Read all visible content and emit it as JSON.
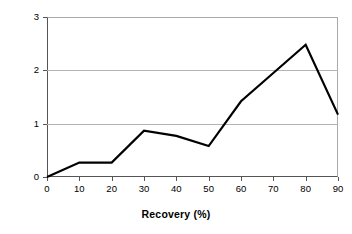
{
  "chart_data": {
    "type": "line",
    "title": "",
    "xlabel": "Recovery (%)",
    "ylabel": "Probability Density",
    "x": [
      0,
      10,
      20,
      30,
      40,
      50,
      60,
      70,
      80,
      90
    ],
    "values": [
      0.0,
      0.27,
      0.27,
      0.87,
      0.77,
      0.58,
      1.42,
      1.95,
      2.48,
      1.17
    ],
    "series": [
      {
        "name": "Probability Density",
        "values": [
          0.0,
          0.27,
          0.27,
          0.87,
          0.77,
          0.58,
          1.42,
          1.95,
          2.48,
          1.17
        ],
        "color": "#000000"
      }
    ],
    "xlim": [
      0,
      90
    ],
    "ylim": [
      0,
      3
    ],
    "xticks": [
      0,
      10,
      20,
      30,
      40,
      50,
      60,
      70,
      80,
      90
    ],
    "xtick_labels": [
      "0",
      "10",
      "20",
      "30",
      "40",
      "50",
      "60",
      "70",
      "80",
      "90"
    ],
    "yticks": [
      0,
      1,
      2,
      3
    ],
    "ytick_labels": [
      "0",
      "1",
      "2",
      "3"
    ],
    "grid": "horizontal",
    "legend": "none",
    "gridline_color": "#b4b4b4",
    "axis_color": "#555555",
    "line_color": "#000000",
    "background": "#ffffff"
  }
}
